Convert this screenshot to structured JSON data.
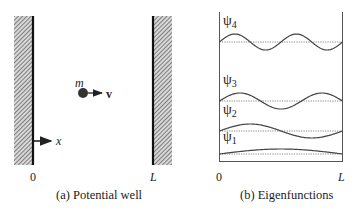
{
  "panel_a": {
    "caption": "(a) Potential well",
    "mass_label": "m",
    "velocity_label": "v",
    "axis_label": "x",
    "left_wall_label": "0",
    "right_wall_label": "L"
  },
  "panel_b": {
    "caption": "(b) Eigenfunctions",
    "x_start_label": "0",
    "x_end_label": "L",
    "functions": [
      {
        "symbol": "ψ",
        "index": "4",
        "half_periods": 4,
        "baseline_y": 42
      },
      {
        "symbol": "ψ",
        "index": "3",
        "half_periods": 3,
        "baseline_y": 101
      },
      {
        "symbol": "ψ",
        "index": "2",
        "half_periods": 2,
        "baseline_y": 131
      },
      {
        "symbol": "ψ",
        "index": "1",
        "half_periods": 1,
        "baseline_y": 154
      }
    ]
  },
  "colors": {
    "line": "#222222",
    "hatch": "#555555",
    "curve": "#444444",
    "dotted": "#666666"
  }
}
